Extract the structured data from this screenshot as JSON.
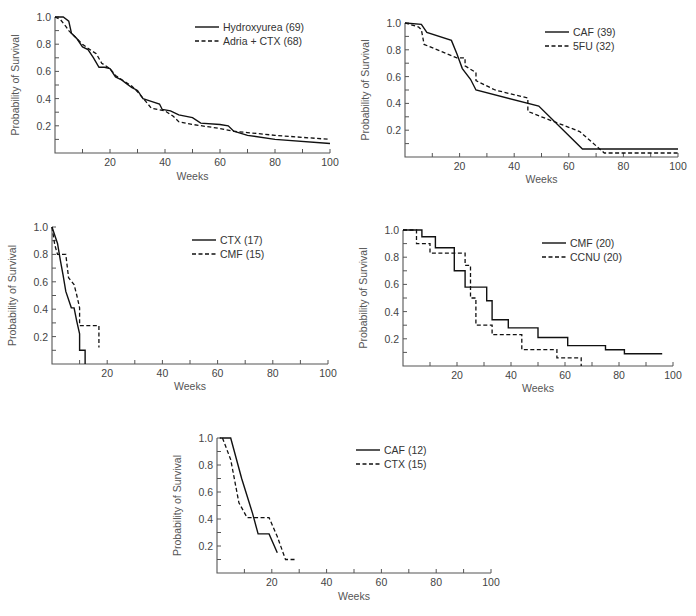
{
  "chart_data": [
    {
      "type": "line",
      "panel": "top-left",
      "title": "",
      "xlabel": "Weeks",
      "ylabel": "Probability of Survival",
      "xlim": [
        0,
        100
      ],
      "ylim": [
        0,
        1.0
      ],
      "xticks": [
        20,
        40,
        60,
        80,
        100
      ],
      "yticks": [
        0.2,
        0.4,
        0.6,
        0.8,
        1.0
      ],
      "grid": false,
      "legend_position": "upper right",
      "series": [
        {
          "name": "Hydroxyurea (69)",
          "style": "solid",
          "x": [
            0,
            3,
            5,
            6,
            8,
            10,
            12,
            14,
            16,
            18,
            20,
            22,
            24,
            26,
            28,
            30,
            32,
            35,
            38,
            39,
            42,
            45,
            50,
            53,
            60,
            63,
            65,
            70,
            80,
            100
          ],
          "y": [
            1.0,
            1.0,
            0.97,
            0.88,
            0.84,
            0.78,
            0.76,
            0.7,
            0.63,
            0.63,
            0.62,
            0.56,
            0.54,
            0.51,
            0.48,
            0.46,
            0.4,
            0.38,
            0.36,
            0.32,
            0.31,
            0.28,
            0.26,
            0.22,
            0.21,
            0.2,
            0.16,
            0.13,
            0.1,
            0.07
          ]
        },
        {
          "name": "Adria + CTX (68)",
          "style": "dashed",
          "x": [
            0,
            2,
            4,
            5,
            7,
            10,
            12,
            15,
            17,
            20,
            22,
            25,
            28,
            30,
            33,
            35,
            40,
            43,
            45,
            50,
            60,
            65,
            70,
            80,
            100
          ],
          "y": [
            1.0,
            0.98,
            0.93,
            0.9,
            0.86,
            0.8,
            0.77,
            0.73,
            0.66,
            0.62,
            0.57,
            0.53,
            0.49,
            0.45,
            0.38,
            0.33,
            0.31,
            0.27,
            0.23,
            0.21,
            0.18,
            0.16,
            0.15,
            0.13,
            0.1
          ]
        }
      ]
    },
    {
      "type": "line",
      "panel": "top-right",
      "title": "",
      "xlabel": "Weeks",
      "ylabel": "Probability of Survival",
      "xlim": [
        0,
        100
      ],
      "ylim": [
        0,
        1.0
      ],
      "xticks": [
        20,
        40,
        60,
        80,
        100
      ],
      "yticks": [
        0.2,
        0.4,
        0.6,
        0.8,
        1.0
      ],
      "grid": false,
      "legend_position": "upper right",
      "series": [
        {
          "name": "CAF (39)",
          "style": "solid",
          "x": [
            0,
            6,
            8,
            17,
            19,
            21,
            24,
            26,
            49,
            65,
            100
          ],
          "y": [
            1.0,
            0.99,
            0.93,
            0.87,
            0.77,
            0.66,
            0.58,
            0.5,
            0.38,
            0.06,
            0.06
          ]
        },
        {
          "name": "5FU (32)",
          "style": "dashed",
          "x": [
            0,
            5,
            6,
            7,
            19,
            22,
            22,
            26,
            26,
            33,
            45,
            45,
            50,
            64,
            73,
            100
          ],
          "y": [
            1.0,
            0.97,
            0.95,
            0.84,
            0.74,
            0.74,
            0.68,
            0.63,
            0.57,
            0.5,
            0.44,
            0.34,
            0.3,
            0.19,
            0.03,
            0.03
          ]
        }
      ]
    },
    {
      "type": "line",
      "panel": "middle-left",
      "title": "",
      "xlabel": "Weeks",
      "ylabel": "Probability of Survival",
      "xlim": [
        0,
        100
      ],
      "ylim": [
        0,
        1.0
      ],
      "xticks": [
        20,
        40,
        60,
        80,
        100
      ],
      "yticks": [
        0.2,
        0.4,
        0.6,
        0.8,
        1.0
      ],
      "grid": false,
      "legend_position": "upper right",
      "series": [
        {
          "name": "CTX (17)",
          "style": "solid",
          "x": [
            0,
            1,
            2,
            3,
            4,
            5,
            7,
            8,
            9,
            10,
            10,
            11,
            12,
            12
          ],
          "y": [
            1.0,
            0.94,
            0.88,
            0.76,
            0.65,
            0.53,
            0.41,
            0.41,
            0.31,
            0.22,
            0.1,
            0.1,
            0.1,
            0.0
          ]
        },
        {
          "name": "CMF (15)",
          "style": "dashed",
          "x": [
            0,
            1,
            2,
            5,
            6,
            8,
            9,
            10,
            10,
            11,
            17,
            17
          ],
          "y": [
            1.0,
            0.87,
            0.8,
            0.8,
            0.63,
            0.58,
            0.5,
            0.41,
            0.28,
            0.28,
            0.28,
            0.12
          ]
        }
      ]
    },
    {
      "type": "line",
      "panel": "middle-right",
      "title": "",
      "xlabel": "Weeks",
      "ylabel": "Probability of Survival",
      "xlim": [
        0,
        100
      ],
      "ylim": [
        0,
        1.0
      ],
      "xticks": [
        20,
        40,
        60,
        80,
        100
      ],
      "yticks": [
        0.2,
        0.4,
        0.6,
        0.8,
        1.0
      ],
      "grid": false,
      "legend_position": "upper right",
      "series": [
        {
          "name": "CMF (20)",
          "style": "solid",
          "steps": [
            [
              0,
              1.0
            ],
            [
              7,
              0.95
            ],
            [
              12,
              0.87
            ],
            [
              19,
              0.7
            ],
            [
              23,
              0.58
            ],
            [
              31,
              0.48
            ],
            [
              33,
              0.34
            ],
            [
              39,
              0.28
            ],
            [
              50,
              0.21
            ],
            [
              61,
              0.15
            ],
            [
              75,
              0.12
            ],
            [
              82,
              0.09
            ],
            [
              96,
              0.09
            ]
          ]
        },
        {
          "name": "CCNU (20)",
          "style": "dashed",
          "steps": [
            [
              0,
              1.0
            ],
            [
              5,
              0.9
            ],
            [
              10,
              0.83
            ],
            [
              23,
              0.74
            ],
            [
              25,
              0.5
            ],
            [
              27,
              0.3
            ],
            [
              33,
              0.23
            ],
            [
              44,
              0.12
            ],
            [
              57,
              0.06
            ],
            [
              66,
              0.0
            ]
          ]
        }
      ]
    },
    {
      "type": "line",
      "panel": "bottom-center",
      "title": "",
      "xlabel": "Weeks",
      "ylabel": "Probability of Survival",
      "xlim": [
        0,
        100
      ],
      "ylim": [
        0,
        1.0
      ],
      "xticks": [
        20,
        40,
        60,
        80,
        100
      ],
      "yticks": [
        0.2,
        0.4,
        0.6,
        0.8,
        1.0
      ],
      "grid": false,
      "legend_position": "upper right",
      "series": [
        {
          "name": "CAF (12)",
          "style": "solid",
          "x": [
            1,
            5,
            9,
            13,
            15,
            19,
            22
          ],
          "y": [
            1.0,
            1.0,
            0.7,
            0.44,
            0.29,
            0.29,
            0.15
          ]
        },
        {
          "name": "CTX (15)",
          "style": "dashed",
          "x": [
            2,
            5,
            8,
            11,
            19,
            22,
            25,
            29
          ],
          "y": [
            1.0,
            0.84,
            0.52,
            0.41,
            0.41,
            0.27,
            0.1,
            0.1
          ]
        }
      ]
    }
  ],
  "labels": {
    "ylabel": "Probability of Survival",
    "xlabel": "Weeks",
    "yticks": [
      "0.2",
      "0.4",
      "0.6",
      "0.8",
      "1.0"
    ],
    "xticks": [
      "20",
      "40",
      "60",
      "80",
      "100"
    ]
  },
  "legends": {
    "p1": [
      "Hydroxyurea (69)",
      "Adria + CTX (68)"
    ],
    "p2": [
      "CAF (39)",
      "5FU (32)"
    ],
    "p3": [
      "CTX (17)",
      "CMF (15)"
    ],
    "p4": [
      "CMF (20)",
      "CCNU (20)"
    ],
    "p5": [
      "CAF (12)",
      "CTX (15)"
    ]
  }
}
